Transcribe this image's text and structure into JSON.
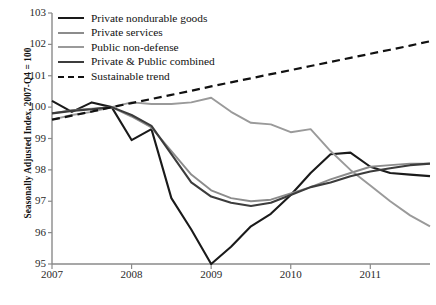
{
  "chart_data": {
    "type": "line",
    "title": "",
    "xlabel": "",
    "ylabel": "Seasonally Adjusted Index, 2007-Q4 = 100",
    "xlim": [
      2007.0,
      2011.75
    ],
    "ylim": [
      95,
      103
    ],
    "ytick_labels": [
      "103",
      "102",
      "101",
      "100",
      "99",
      "98",
      "97",
      "96",
      "95"
    ],
    "ytick_values": [
      103,
      102,
      101,
      100,
      99,
      98,
      97,
      96,
      95
    ],
    "xtick_labels": [
      "2007",
      "2008",
      "2009",
      "2010",
      "2011"
    ],
    "xtick_values": [
      2007,
      2008,
      2009,
      2010,
      2011
    ],
    "grid": false,
    "legend_position": "top-left",
    "x": [
      2007.0,
      2007.25,
      2007.5,
      2007.75,
      2008.0,
      2008.25,
      2008.5,
      2008.75,
      2009.0,
      2009.25,
      2009.5,
      2009.75,
      2010.0,
      2010.25,
      2010.5,
      2010.75,
      2011.0,
      2011.25,
      2011.5,
      2011.75
    ],
    "series": [
      {
        "name": "Private nondurable goods",
        "color": "#1a1a1a",
        "width": 2.1,
        "dash": "none",
        "values": [
          100.2,
          99.85,
          100.15,
          100.0,
          98.95,
          99.3,
          97.1,
          96.1,
          95.0,
          95.55,
          96.2,
          96.6,
          97.2,
          97.9,
          98.5,
          98.55,
          98.1,
          97.9,
          97.85,
          97.8
        ]
      },
      {
        "name": "Private services",
        "color": "#8c8c8c",
        "width": 1.9,
        "dash": "none",
        "values": [
          99.8,
          99.9,
          99.95,
          100.0,
          99.7,
          99.35,
          98.6,
          97.85,
          97.35,
          97.1,
          97.0,
          97.05,
          97.25,
          97.45,
          97.7,
          97.9,
          98.1,
          98.15,
          98.2,
          98.2
        ]
      },
      {
        "name": "Public non-defense",
        "color": "#9a9a9a",
        "width": 1.9,
        "dash": "none",
        "values": [
          99.6,
          99.75,
          99.85,
          100.0,
          100.15,
          100.1,
          100.1,
          100.15,
          100.3,
          99.85,
          99.5,
          99.45,
          99.2,
          99.3,
          98.6,
          98.0,
          97.5,
          97.0,
          96.55,
          96.2
        ]
      },
      {
        "name": "Private & Public combined",
        "color": "#3c3c3c",
        "width": 2.1,
        "dash": "none",
        "values": [
          99.8,
          99.88,
          99.93,
          100.0,
          99.75,
          99.4,
          98.5,
          97.6,
          97.15,
          96.95,
          96.85,
          96.95,
          97.2,
          97.45,
          97.6,
          97.8,
          97.95,
          98.05,
          98.15,
          98.2
        ]
      },
      {
        "name": "Sustainable trend",
        "color": "#111111",
        "width": 2.2,
        "dash": "8,5",
        "values": [
          99.6,
          99.73,
          99.86,
          100.0,
          100.13,
          100.26,
          100.39,
          100.52,
          100.66,
          100.79,
          100.92,
          101.05,
          101.18,
          101.31,
          101.44,
          101.57,
          101.7,
          101.83,
          101.96,
          102.1
        ]
      }
    ],
    "axis_color": "#8a8a8a"
  },
  "legend": {
    "items": [
      {
        "label": "Private nondurable goods",
        "color": "#1a1a1a",
        "dash": "none"
      },
      {
        "label": "Private services",
        "color": "#8c8c8c",
        "dash": "none"
      },
      {
        "label": "Public non-defense",
        "color": "#9a9a9a",
        "dash": "none"
      },
      {
        "label": "Private & Public combined",
        "color": "#3c3c3c",
        "dash": "none"
      },
      {
        "label": "Sustainable trend",
        "color": "#111111",
        "dash": "dashed"
      }
    ]
  },
  "footnote": {
    "text": ""
  }
}
